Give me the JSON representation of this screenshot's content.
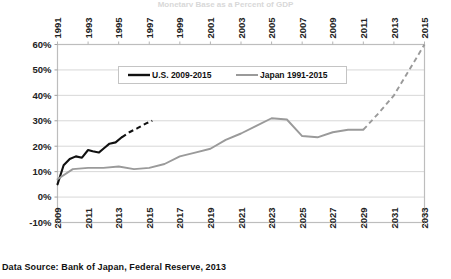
{
  "figure": {
    "top_title": "Monetary Base as a Percent of GDP",
    "source_note": "Data Source: Bank of Japan, Federal Reserve, 2013"
  },
  "chart_data": {
    "type": "line",
    "title": "Monetary Base as a Percent of GDP",
    "xlabel": "",
    "ylabel": "",
    "ylim": [
      -10,
      60
    ],
    "ytick_values": [
      60,
      50,
      40,
      30,
      20,
      10,
      0,
      -10
    ],
    "ytick_labels": [
      "60%",
      "50%",
      "40%",
      "30%",
      "20%",
      "10%",
      "0%",
      "-10%"
    ],
    "grid": true,
    "legend_position": "top-center",
    "top_axis": {
      "name": "Japan year axis",
      "range": [
        1991,
        2015
      ],
      "ticks": [
        1991,
        1993,
        1995,
        1997,
        1999,
        2001,
        2003,
        2005,
        2007,
        2009,
        2011,
        2013,
        2015
      ],
      "tick_labels": [
        "1991",
        "1993",
        "1995",
        "1997",
        "1999",
        "2001",
        "2003",
        "2005",
        "2007",
        "2009",
        "2011",
        "2013",
        "2015"
      ]
    },
    "bottom_axis": {
      "name": "U.S. year axis",
      "range": [
        2009,
        2033
      ],
      "ticks": [
        2009,
        2011,
        2013,
        2015,
        2017,
        2019,
        2021,
        2023,
        2025,
        2027,
        2029,
        2031,
        2033
      ],
      "tick_labels": [
        "2009",
        "2011",
        "2013",
        "2015",
        "2017",
        "2019",
        "2021",
        "2023",
        "2025",
        "2027",
        "2029",
        "2031",
        "2033"
      ]
    },
    "series": [
      {
        "name": "U.S. 2009-2015",
        "color": "#111111",
        "axis": "bottom",
        "solid_x": [
          2009.0,
          2009.4,
          2009.8,
          2010.2,
          2010.6,
          2011.0,
          2011.3,
          2011.7,
          2012.0,
          2012.4,
          2012.8,
          2013.2
        ],
        "solid_values": [
          5.0,
          12.5,
          15.0,
          16.0,
          15.5,
          18.5,
          18.0,
          17.5,
          19.0,
          21.0,
          21.5,
          23.5
        ],
        "dashed_x": [
          2013.2,
          2013.7,
          2014.2,
          2014.8,
          2015.2
        ],
        "dashed_values": [
          23.5,
          25.5,
          27.0,
          29.0,
          30.0
        ]
      },
      {
        "name": "Japan 1991-2015",
        "color": "#9a9a9a",
        "axis": "top",
        "solid_x": [
          1991,
          1992,
          1993,
          1994,
          1995,
          1996,
          1997,
          1998,
          1999,
          2000,
          2001,
          2002,
          2003,
          2004,
          2005,
          2006,
          2007,
          2008,
          2009,
          2010,
          2011
        ],
        "solid_values": [
          7.0,
          11.0,
          11.5,
          11.5,
          12.0,
          11.0,
          11.5,
          13.0,
          16.0,
          17.5,
          19.0,
          22.5,
          25.0,
          28.0,
          31.0,
          30.5,
          24.0,
          23.5,
          25.5,
          26.5,
          26.5
        ],
        "dashed_x": [
          2011,
          2012,
          2013,
          2014,
          2015
        ],
        "dashed_values": [
          26.5,
          33.0,
          40.0,
          50.0,
          60.0
        ],
        "note": "dashed segment is projection from 2011 onward reaching 60%"
      }
    ]
  },
  "legend": {
    "entries": [
      {
        "label": "U.S. 2009-2015",
        "color": "#111111"
      },
      {
        "label": "Japan 1991-2015",
        "color": "#9a9a9a"
      }
    ]
  }
}
